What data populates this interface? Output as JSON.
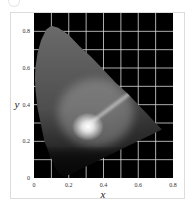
{
  "chart_data": {
    "type": "heatmap",
    "title": "",
    "xlabel": "x",
    "ylabel": "y",
    "xlim": [
      0,
      0.8
    ],
    "ylim": [
      0,
      0.9
    ],
    "x_ticks": [
      0,
      0.2,
      0.4,
      0.6,
      0.8
    ],
    "x_tick_labels": [
      "0",
      "0.2",
      "0.4",
      "0.6",
      "0.8"
    ],
    "y_ticks": [
      0,
      0.2,
      0.4,
      0.6,
      0.8
    ],
    "y_tick_labels": [
      "0",
      "0.2",
      "0.4",
      "0.6",
      "0.8"
    ],
    "grid": true,
    "grid_step": 0.1,
    "grid_color": "#d8d8d8",
    "background_color": "#000000",
    "legend": null,
    "spectral_locus": [
      [
        0.175,
        0.005
      ],
      [
        0.17,
        0.006
      ],
      [
        0.16,
        0.015
      ],
      [
        0.14,
        0.03
      ],
      [
        0.12,
        0.06
      ],
      [
        0.09,
        0.13
      ],
      [
        0.06,
        0.2
      ],
      [
        0.04,
        0.29
      ],
      [
        0.02,
        0.38
      ],
      [
        0.01,
        0.47
      ],
      [
        0.005,
        0.54
      ],
      [
        0.008,
        0.6
      ],
      [
        0.02,
        0.68
      ],
      [
        0.04,
        0.75
      ],
      [
        0.07,
        0.81
      ],
      [
        0.1,
        0.83
      ],
      [
        0.14,
        0.82
      ],
      [
        0.2,
        0.78
      ],
      [
        0.26,
        0.72
      ],
      [
        0.33,
        0.66
      ],
      [
        0.4,
        0.59
      ],
      [
        0.47,
        0.52
      ],
      [
        0.54,
        0.46
      ],
      [
        0.61,
        0.39
      ],
      [
        0.67,
        0.33
      ],
      [
        0.71,
        0.29
      ],
      [
        0.735,
        0.265
      ]
    ],
    "white_point": {
      "x": 0.31,
      "y": 0.28
    },
    "highlight_streak": {
      "from": [
        0.31,
        0.29
      ],
      "to": [
        0.55,
        0.46
      ]
    }
  },
  "corner_label": ""
}
